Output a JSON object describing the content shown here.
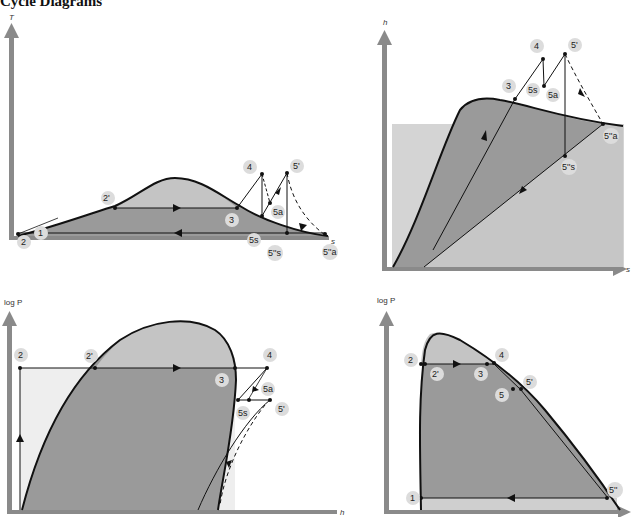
{
  "title": "Cycle Diagrams",
  "colors": {
    "dome_fill": "#9a9a9a",
    "dome_light": "#c4c4c4",
    "background_light": "#ececec",
    "axis": "#8a8a8a",
    "curve": "#111111",
    "label_bubble": "#dcdcdc"
  },
  "diagrams": [
    {
      "id": "T-s",
      "y_axis": "T",
      "x_axis": "s",
      "labels": [
        "1",
        "2",
        "2'",
        "3",
        "4",
        "5s",
        "5a",
        "5'",
        "5''s",
        "5''a"
      ]
    },
    {
      "id": "h-s",
      "y_axis": "h",
      "x_axis": "s",
      "labels": [
        "3",
        "4",
        "5s",
        "5a",
        "5'",
        "5''s",
        "5''a"
      ]
    },
    {
      "id": "logP-h-left",
      "y_axis": "log P",
      "x_axis": "h",
      "labels": [
        "2",
        "2'",
        "3",
        "4",
        "5s",
        "5a",
        "5'"
      ]
    },
    {
      "id": "logP-h-right",
      "y_axis": "log P",
      "x_axis": "h",
      "labels": [
        "1",
        "2",
        "2'",
        "3",
        "4",
        "5",
        "5'",
        "5''"
      ]
    }
  ]
}
